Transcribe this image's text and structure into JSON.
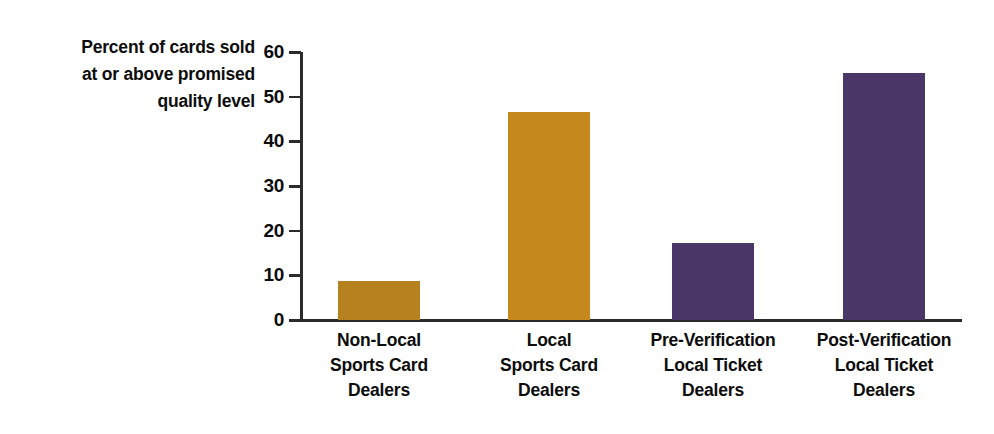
{
  "chart_data": {
    "type": "bar",
    "title": "",
    "xlabel": "",
    "ylabel": "Percent of cards sold at or above promised quality level",
    "ylabel_lines": [
      "Percent of cards sold",
      "at or above promised",
      "quality level"
    ],
    "categories": [
      "Non-Local Sports Card Dealers",
      "Local Sports Card Dealers",
      "Pre-Verification Local Ticket Dealers",
      "Post-Verification Local Ticket Dealers"
    ],
    "category_lines": [
      [
        "Non-Local",
        "Sports Card",
        "Dealers"
      ],
      [
        "Local",
        "Sports Card",
        "Dealers"
      ],
      [
        "Pre-Verification",
        "Local Ticket",
        "Dealers"
      ],
      [
        "Post-Verification",
        "Local Ticket",
        "Dealers"
      ]
    ],
    "values": [
      8.7,
      46.5,
      17.2,
      55.3
    ],
    "bar_colors": [
      "#b5821f",
      "#c5881d",
      "#4a3768",
      "#4a3768"
    ],
    "ylim": [
      0,
      60
    ],
    "yticks": [
      0,
      10,
      20,
      30,
      40,
      50,
      60
    ],
    "ytick_labels": [
      "0",
      "10",
      "20",
      "30",
      "40",
      "50",
      "60"
    ],
    "grid": false,
    "legend": "none",
    "axis_color": "#2b2b2b"
  }
}
